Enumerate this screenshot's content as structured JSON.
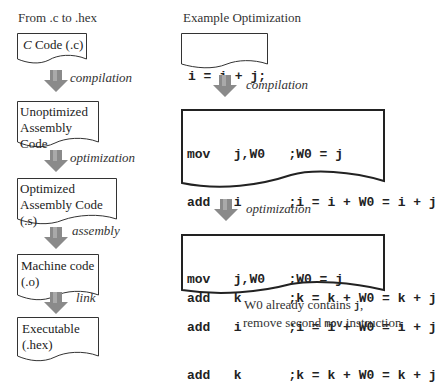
{
  "left": {
    "heading": "From .c to .hex",
    "docs": [
      {
        "line1": "C Code (.c)",
        "italic_prefix": "C",
        "rest": " Code (.c)"
      },
      {
        "line1": "Unoptimized",
        "line2": "Assembly Code"
      },
      {
        "line1": "Optimized",
        "line2": "Assembly Code (.s)"
      },
      {
        "line1": "Machine code",
        "line2": "(.o)"
      },
      {
        "line1": "Executable",
        "line2": "(.hex)"
      }
    ],
    "arrows": [
      "compilation",
      "optimization",
      "assembly",
      "link"
    ]
  },
  "right": {
    "heading": "Example Optimization",
    "source_code": [
      "i = i + j;",
      "k = k + j;"
    ],
    "arrow1": "compilation",
    "unoptimized_asm": [
      "mov   j,W0   ;W0 = j",
      "add   i      ;i = i + W0 = i + j",
      "mov   j,W0   ;W0 = j",
      "add   k      ;k = k + W0 = k + j"
    ],
    "arrow2": "optimization",
    "optimized_asm": [
      "mov   j,W0   ;W0 = j",
      "add   i      ;i = i + W0 = i + j",
      "add   k      ;k = k + W0 = k + j"
    ],
    "note": {
      "line1_prefix": "W0 already contains ",
      "line1_code": "j",
      "line1_suffix": ",",
      "line2_prefix": "remove second ",
      "line2_code": "mov",
      "line2_suffix": " instruction"
    }
  },
  "colors": {
    "arrow_fill": "#8a8a8a",
    "arrow_light": "#b5b5b5",
    "stroke": "#333333"
  }
}
